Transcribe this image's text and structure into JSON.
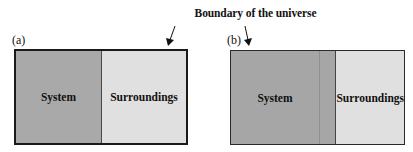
{
  "title": "Boundary of the universe",
  "panels": {
    "a": {
      "label": "(a)",
      "system": "System",
      "surroundings": "Surroundings"
    },
    "b": {
      "label": "(b)",
      "system": "System",
      "surroundings": "Surroundings"
    }
  },
  "colors": {
    "system": "#a9a9a9",
    "surroundings": "#e0e0e0",
    "boundary": "#1a1a1a"
  }
}
